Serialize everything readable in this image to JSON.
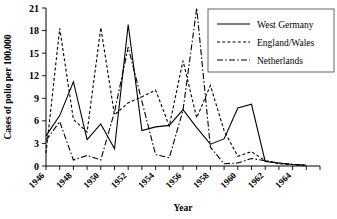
{
  "chart_data": {
    "type": "line",
    "title": "",
    "xlabel": "Year",
    "ylabel": "Cases of polio per 100,000",
    "xlim": [
      1946,
      1966
    ],
    "ylim": [
      0,
      21
    ],
    "yticks": [
      0,
      3,
      6,
      9,
      12,
      15,
      18,
      21
    ],
    "xticks": [
      1946,
      1948,
      1950,
      1952,
      1954,
      1956,
      1958,
      1960,
      1962,
      1964
    ],
    "x_minor_tick_step": 1,
    "grid": false,
    "legend_position": "top-right",
    "x": [
      1946,
      1947,
      1948,
      1949,
      1950,
      1951,
      1952,
      1953,
      1954,
      1955,
      1956,
      1957,
      1958,
      1959,
      1960,
      1961,
      1962,
      1963,
      1964,
      1965
    ],
    "series": [
      {
        "name": "West Germany",
        "style": "solid",
        "values": [
          4.0,
          6.7,
          11.2,
          3.5,
          5.6,
          2.3,
          18.8,
          4.7,
          5.2,
          5.4,
          7.5,
          5.1,
          2.9,
          3.6,
          7.7,
          8.2,
          0.6,
          0.4,
          0.2,
          0.1
        ]
      },
      {
        "name": "England/Wales",
        "style": "dashed",
        "values": [
          1.7,
          18.3,
          6.2,
          4.5,
          18.4,
          6.8,
          8.4,
          9.2,
          10.1,
          5.3,
          14.0,
          6.4,
          10.7,
          4.7,
          1.3,
          1.9,
          0.7,
          0.3,
          0.2,
          0.1
        ]
      },
      {
        "name": "Netherlands",
        "style": "dashdot",
        "values": [
          3.4,
          5.9,
          0.8,
          1.4,
          0.8,
          7.2,
          15.8,
          8.6,
          1.5,
          1.1,
          7.4,
          21.0,
          2.5,
          0.3,
          0.4,
          1.0,
          0.7,
          0.4,
          0.2,
          0.1
        ]
      }
    ],
    "legend_entries": [
      {
        "label": "West Germany",
        "style": "solid"
      },
      {
        "label": "England/Wales",
        "style": "dashed"
      },
      {
        "label": "Netherlands",
        "style": "dashdot"
      }
    ]
  }
}
